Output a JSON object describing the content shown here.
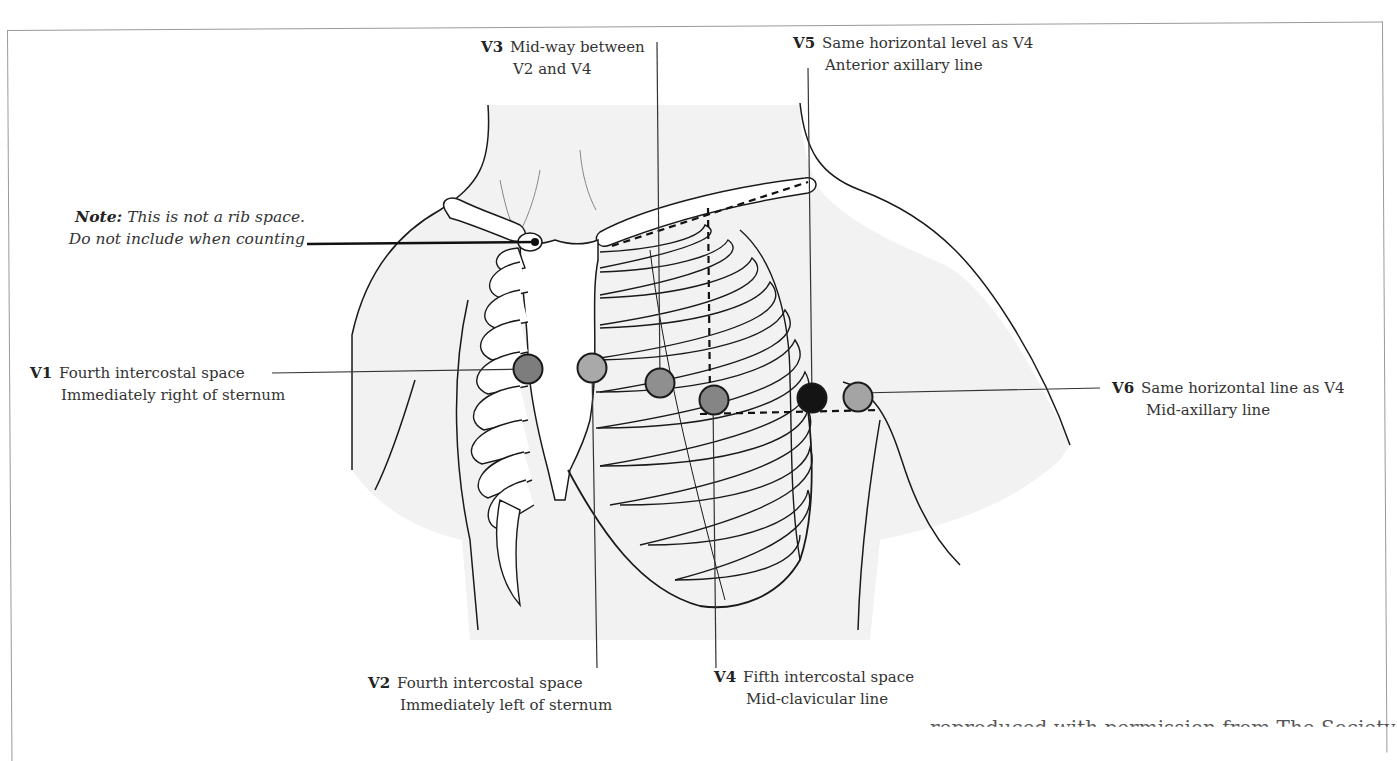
{
  "figure": {
    "colors": {
      "skin_shade": "#f2f2f2",
      "outline": "#1a1a1a",
      "electrode_v1": "#7d7d7d",
      "electrode_v2": "#a9a9a9",
      "electrode_v3": "#8f8f8f",
      "electrode_v4": "#858585",
      "electrode_v5": "#141414",
      "electrode_v6": "#a4a4a4",
      "frame": "#9a9a9a"
    }
  },
  "note": {
    "bold": "Note:",
    "line1": "This is not a rib space.",
    "line2": "Do not include when counting"
  },
  "leads": [
    {
      "code": "V1",
      "line1": "Fourth intercostal space",
      "line2": "Immediately right of sternum"
    },
    {
      "code": "V2",
      "line1": "Fourth intercostal space",
      "line2": "Immediately left of sternum"
    },
    {
      "code": "V3",
      "line1": "Mid-way between",
      "line2": "V2 and V4"
    },
    {
      "code": "V4",
      "line1": "Fifth intercostal space",
      "line2": "Mid-clavicular line"
    },
    {
      "code": "V5",
      "line1": "Same horizontal level as V4",
      "line2": "Anterior axillary line"
    },
    {
      "code": "V6",
      "line1": "Same horizontal line as V4",
      "line2": "Mid-axillary line"
    }
  ],
  "caption": {
    "partial_text": "reproduced with permission from The Society"
  }
}
